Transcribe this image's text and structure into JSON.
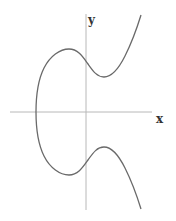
{
  "diagram": {
    "type": "elliptic-curve",
    "axes": {
      "x_label": "x",
      "y_label": "y"
    },
    "colors": {
      "axis": "#b8b8b8",
      "curve": "#6a6a6a",
      "label": "#333333",
      "background": "#ffffff"
    }
  }
}
